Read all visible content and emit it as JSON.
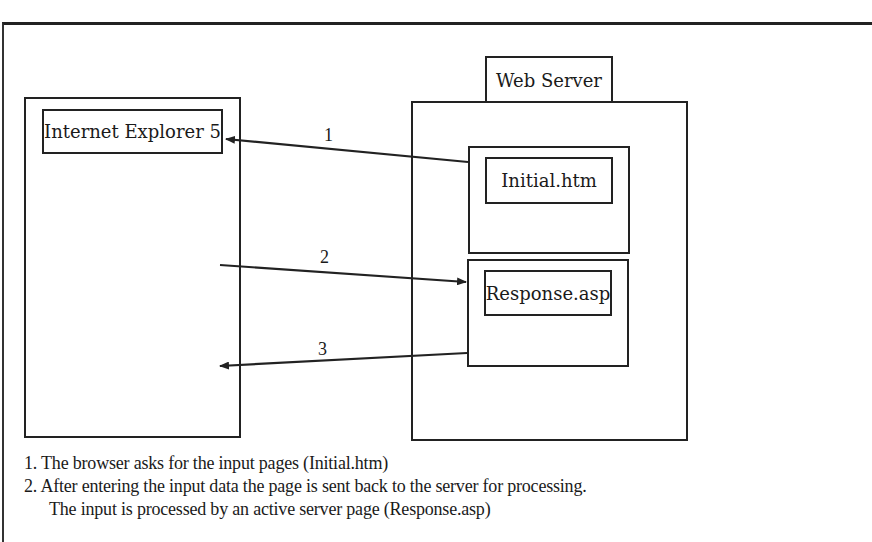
{
  "diagram": {
    "browser": {
      "label": "Internet Explorer 5"
    },
    "server": {
      "label": "Web Server",
      "pages": [
        {
          "label": "Initial.htm"
        },
        {
          "label": "Response.asp"
        }
      ]
    },
    "arrows": [
      {
        "id": "1",
        "label": "1",
        "from": "Initial.htm",
        "to": "Internet Explorer 5"
      },
      {
        "id": "2",
        "label": "2",
        "from": "Browser",
        "to": "Response.asp"
      },
      {
        "id": "3",
        "label": "3",
        "from": "Response.asp",
        "to": "Browser"
      }
    ],
    "notes": [
      "1. The browser asks for the input pages (Initial.htm)",
      "2. After entering the input data the page is sent back to the server for processing.",
      "The input is processed by an active server page (Response.asp)"
    ],
    "colors": {
      "line": "#222222",
      "background": "#ffffff"
    }
  }
}
